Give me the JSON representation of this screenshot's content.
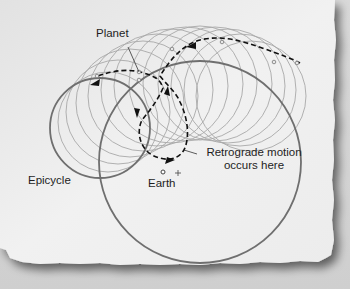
{
  "diagram": {
    "labels": {
      "planet": "Planet",
      "epicycle": "Epicycle",
      "earth": "Earth",
      "retrograde_line1": "Retrograde motion",
      "retrograde_line2": "occurs here"
    },
    "colors": {
      "paper": "#efefef",
      "background": "#d4d4d4",
      "thin_circle": "#a8a8a8",
      "thick_circle": "#6f6f6f",
      "path": "#111111",
      "text": "#1e1e1e"
    },
    "markers": {
      "earth_symbol": "●",
      "center_symbol": "+"
    }
  }
}
